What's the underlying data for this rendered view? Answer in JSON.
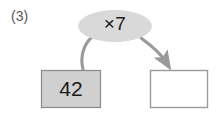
{
  "problem": {
    "number_label": "(3)"
  },
  "diagram": {
    "type": "function-machine",
    "operator_bubble": {
      "label": "×7",
      "shape": "ellipse",
      "fill": "#d9d9d9",
      "text_color": "#1a1a1a",
      "cx": 115,
      "cy": 26,
      "rx": 37,
      "ry": 16
    },
    "input_box": {
      "value": "42",
      "fill": "#d0d0d0",
      "stroke": "#8a8a8a",
      "x": 41,
      "y": 70,
      "width": 60,
      "height": 38
    },
    "output_box": {
      "value": "",
      "fill": "#ffffff",
      "stroke": "#9a9a9a",
      "x": 150,
      "y": 70,
      "width": 58,
      "height": 38
    },
    "connectors": [
      {
        "name": "input-to-bubble",
        "from": "input_box",
        "to": "operator_bubble",
        "arrowhead": false,
        "color": "#9a9a9a"
      },
      {
        "name": "bubble-to-output",
        "from": "operator_bubble",
        "to": "output_box",
        "arrowhead": true,
        "color": "#9a9a9a"
      }
    ]
  },
  "colors": {
    "background": "#ffffff",
    "bubble_fill": "#d9d9d9",
    "box_fill": "#d0d0d0",
    "line": "#9a9a9a",
    "text": "#1a1a1a",
    "label_text": "#58585a"
  }
}
